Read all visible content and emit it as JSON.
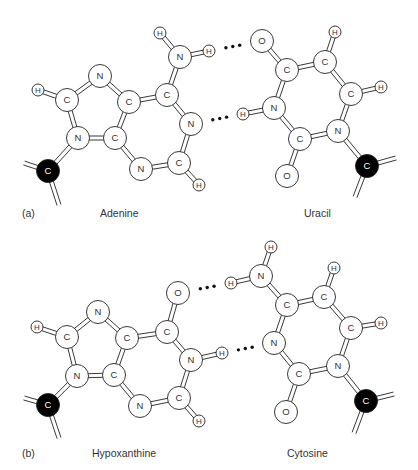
{
  "figure": {
    "panels": [
      {
        "id": "a",
        "panel_label": "(a)",
        "left_molecule_name": "Adenine",
        "right_molecule_name": "Uracil",
        "label_y": 218,
        "panel_label_x": 22,
        "left_name_x": 100,
        "right_name_x": 304
      },
      {
        "id": "b",
        "panel_label": "(b)",
        "left_molecule_name": "Hypoxanthine",
        "right_molecule_name": "Cytosine",
        "label_y": 458,
        "panel_label_x": 22,
        "left_name_x": 92,
        "right_name_x": 287
      }
    ],
    "colors": {
      "atom_fill": "#ffffff",
      "atom_stroke": "#222222",
      "sugar_carbon_fill": "#000000",
      "sugar_carbon_text": "#ffffff",
      "bond_stroke": "#222222",
      "text": "#333333"
    },
    "molecules": [
      {
        "name": "Adenine",
        "atoms": [
          {
            "id": "a_h8",
            "el": "H",
            "x": 38,
            "y": 90
          },
          {
            "id": "a_c8",
            "el": "C",
            "x": 67,
            "y": 100
          },
          {
            "id": "a_n7",
            "el": "N",
            "x": 100,
            "y": 76
          },
          {
            "id": "a_c5",
            "el": "C",
            "x": 129,
            "y": 102
          },
          {
            "id": "a_c6",
            "el": "C",
            "x": 167,
            "y": 95
          },
          {
            "id": "a_n6",
            "el": "N",
            "x": 180,
            "y": 57
          },
          {
            "id": "a_h6a",
            "el": "H",
            "x": 160,
            "y": 33
          },
          {
            "id": "a_h6b",
            "el": "H",
            "x": 209,
            "y": 51
          },
          {
            "id": "a_n1",
            "el": "N",
            "x": 191,
            "y": 124
          },
          {
            "id": "a_c2",
            "el": "C",
            "x": 179,
            "y": 163
          },
          {
            "id": "a_h2",
            "el": "H",
            "x": 199,
            "y": 185
          },
          {
            "id": "a_n3",
            "el": "N",
            "x": 141,
            "y": 169
          },
          {
            "id": "a_c4",
            "el": "C",
            "x": 115,
            "y": 138
          },
          {
            "id": "a_n9",
            "el": "N",
            "x": 78,
            "y": 138
          },
          {
            "id": "a_c1",
            "el": "C",
            "x": 48,
            "y": 171,
            "sugar": true
          }
        ],
        "bonds": [
          [
            "a_h8",
            "a_c8"
          ],
          [
            "a_c8",
            "a_n7"
          ],
          [
            "a_n7",
            "a_c5"
          ],
          [
            "a_c5",
            "a_c6"
          ],
          [
            "a_c6",
            "a_n6"
          ],
          [
            "a_n6",
            "a_h6a"
          ],
          [
            "a_n6",
            "a_h6b"
          ],
          [
            "a_c6",
            "a_n1"
          ],
          [
            "a_n1",
            "a_c2"
          ],
          [
            "a_c2",
            "a_h2"
          ],
          [
            "a_c2",
            "a_n3"
          ],
          [
            "a_n3",
            "a_c4"
          ],
          [
            "a_c4",
            "a_c5"
          ],
          [
            "a_c4",
            "a_n9"
          ],
          [
            "a_n9",
            "a_c8"
          ],
          [
            "a_n9",
            "a_c1"
          ]
        ],
        "stubs": [
          {
            "from": "a_c1",
            "x": 24,
            "y": 163
          },
          {
            "from": "a_c1",
            "x": 59,
            "y": 205
          }
        ]
      },
      {
        "name": "Uracil",
        "atoms": [
          {
            "id": "u_o4",
            "el": "O",
            "x": 262,
            "y": 41
          },
          {
            "id": "u_c4",
            "el": "C",
            "x": 287,
            "y": 70
          },
          {
            "id": "u_c5",
            "el": "C",
            "x": 325,
            "y": 62
          },
          {
            "id": "u_h5",
            "el": "H",
            "x": 335,
            "y": 32
          },
          {
            "id": "u_c6",
            "el": "C",
            "x": 351,
            "y": 94
          },
          {
            "id": "u_h6",
            "el": "H",
            "x": 381,
            "y": 87
          },
          {
            "id": "u_n1",
            "el": "N",
            "x": 338,
            "y": 131
          },
          {
            "id": "u_c2",
            "el": "C",
            "x": 300,
            "y": 139
          },
          {
            "id": "u_o2",
            "el": "O",
            "x": 287,
            "y": 176
          },
          {
            "id": "u_n3",
            "el": "N",
            "x": 274,
            "y": 108
          },
          {
            "id": "u_h3",
            "el": "H",
            "x": 243,
            "y": 114
          },
          {
            "id": "u_c1",
            "el": "C",
            "x": 367,
            "y": 166,
            "sugar": true
          }
        ],
        "bonds": [
          [
            "u_o4",
            "u_c4"
          ],
          [
            "u_c4",
            "u_c5"
          ],
          [
            "u_c5",
            "u_h5"
          ],
          [
            "u_c5",
            "u_c6"
          ],
          [
            "u_c6",
            "u_h6"
          ],
          [
            "u_c6",
            "u_n1"
          ],
          [
            "u_n1",
            "u_c2"
          ],
          [
            "u_c2",
            "u_o2"
          ],
          [
            "u_c2",
            "u_n3"
          ],
          [
            "u_n3",
            "u_c4"
          ],
          [
            "u_n3",
            "u_h3"
          ],
          [
            "u_n1",
            "u_c1"
          ]
        ],
        "stubs": [
          {
            "from": "u_c1",
            "x": 396,
            "y": 158
          },
          {
            "from": "u_c1",
            "x": 355,
            "y": 197
          }
        ]
      },
      {
        "name": "Hypoxanthine",
        "atoms": [
          {
            "id": "h_h8",
            "el": "H",
            "x": 37,
            "y": 327
          },
          {
            "id": "h_c8",
            "el": "C",
            "x": 67,
            "y": 337
          },
          {
            "id": "h_n7",
            "el": "N",
            "x": 98,
            "y": 312
          },
          {
            "id": "h_c5",
            "el": "C",
            "x": 127,
            "y": 338
          },
          {
            "id": "h_c6",
            "el": "C",
            "x": 167,
            "y": 332
          },
          {
            "id": "h_o6",
            "el": "O",
            "x": 178,
            "y": 293
          },
          {
            "id": "h_n1",
            "el": "N",
            "x": 191,
            "y": 360
          },
          {
            "id": "h_h1",
            "el": "H",
            "x": 222,
            "y": 353
          },
          {
            "id": "h_c2",
            "el": "C",
            "x": 179,
            "y": 398
          },
          {
            "id": "h_h2",
            "el": "H",
            "x": 199,
            "y": 421
          },
          {
            "id": "h_n3",
            "el": "N",
            "x": 140,
            "y": 406
          },
          {
            "id": "h_c4",
            "el": "C",
            "x": 114,
            "y": 375
          },
          {
            "id": "h_n9",
            "el": "N",
            "x": 77,
            "y": 376
          },
          {
            "id": "h_c1",
            "el": "C",
            "x": 48,
            "y": 405,
            "sugar": true
          }
        ],
        "bonds": [
          [
            "h_h8",
            "h_c8"
          ],
          [
            "h_c8",
            "h_n7"
          ],
          [
            "h_n7",
            "h_c5"
          ],
          [
            "h_c5",
            "h_c6"
          ],
          [
            "h_c6",
            "h_o6"
          ],
          [
            "h_c6",
            "h_n1"
          ],
          [
            "h_n1",
            "h_h1"
          ],
          [
            "h_n1",
            "h_c2"
          ],
          [
            "h_c2",
            "h_h2"
          ],
          [
            "h_c2",
            "h_n3"
          ],
          [
            "h_n3",
            "h_c4"
          ],
          [
            "h_c4",
            "h_c5"
          ],
          [
            "h_c4",
            "h_n9"
          ],
          [
            "h_n9",
            "h_c8"
          ],
          [
            "h_n9",
            "h_c1"
          ]
        ],
        "stubs": [
          {
            "from": "h_c1",
            "x": 24,
            "y": 398
          },
          {
            "from": "h_c1",
            "x": 59,
            "y": 438
          }
        ]
      },
      {
        "name": "Cytosine",
        "atoms": [
          {
            "id": "c_h4a",
            "el": "H",
            "x": 271,
            "y": 247
          },
          {
            "id": "c_n4",
            "el": "N",
            "x": 261,
            "y": 276
          },
          {
            "id": "c_h4b",
            "el": "H",
            "x": 231,
            "y": 283
          },
          {
            "id": "c_c4",
            "el": "C",
            "x": 287,
            "y": 305
          },
          {
            "id": "c_c5",
            "el": "C",
            "x": 324,
            "y": 297
          },
          {
            "id": "c_h5",
            "el": "H",
            "x": 334,
            "y": 268
          },
          {
            "id": "c_c6",
            "el": "C",
            "x": 351,
            "y": 328
          },
          {
            "id": "c_h6",
            "el": "H",
            "x": 381,
            "y": 323
          },
          {
            "id": "c_n1",
            "el": "N",
            "x": 338,
            "y": 366
          },
          {
            "id": "c_c2",
            "el": "C",
            "x": 299,
            "y": 374
          },
          {
            "id": "c_o2",
            "el": "O",
            "x": 286,
            "y": 412
          },
          {
            "id": "c_n3",
            "el": "N",
            "x": 274,
            "y": 343
          },
          {
            "id": "c_c1",
            "el": "C",
            "x": 366,
            "y": 401,
            "sugar": true
          }
        ],
        "bonds": [
          [
            "c_h4a",
            "c_n4"
          ],
          [
            "c_n4",
            "c_h4b"
          ],
          [
            "c_n4",
            "c_c4"
          ],
          [
            "c_c4",
            "c_c5"
          ],
          [
            "c_c5",
            "c_h5"
          ],
          [
            "c_c5",
            "c_c6"
          ],
          [
            "c_c6",
            "c_h6"
          ],
          [
            "c_c6",
            "c_n1"
          ],
          [
            "c_n1",
            "c_c2"
          ],
          [
            "c_c2",
            "c_o2"
          ],
          [
            "c_c2",
            "c_n3"
          ],
          [
            "c_n3",
            "c_c4"
          ],
          [
            "c_n1",
            "c_c1"
          ]
        ],
        "stubs": [
          {
            "from": "c_c1",
            "x": 394,
            "y": 394
          },
          {
            "from": "c_c1",
            "x": 354,
            "y": 433
          }
        ]
      }
    ],
    "hydrogen_bonds": [
      {
        "from": "a_h6b",
        "to": "u_o4",
        "label": "N-H···O"
      },
      {
        "from": "a_n1",
        "to": "u_h3",
        "label": "N···H-N"
      },
      {
        "from": "h_o6",
        "to": "c_h4b",
        "label": "O···H-N"
      },
      {
        "from": "h_h1",
        "to": "c_n3",
        "label": "N-H···N"
      }
    ]
  }
}
